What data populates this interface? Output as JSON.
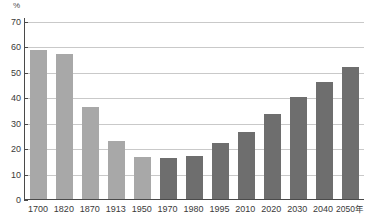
{
  "chart_data": {
    "type": "bar",
    "title": "",
    "subtitle": "",
    "xlabel": "",
    "ylabel": "",
    "unit_label": "%",
    "axis_suffix": "年",
    "categories": [
      "1700",
      "1820",
      "1870",
      "1913",
      "1950",
      "1970",
      "1980",
      "1995",
      "2010",
      "2020",
      "2030",
      "2040",
      "2050年"
    ],
    "values": [
      58.5,
      57,
      36,
      23,
      16.5,
      16,
      17,
      22,
      26.5,
      33.5,
      40,
      46,
      52
    ],
    "bar_styles": [
      "light",
      "light",
      "light",
      "light",
      "light",
      "dark",
      "dark",
      "dark",
      "dark",
      "dark",
      "dark",
      "dark",
      "dark"
    ],
    "ylim": [
      0,
      70
    ],
    "yticks": [
      0,
      10,
      20,
      30,
      40,
      50,
      60,
      70
    ],
    "ytick_labels": [
      "0",
      "10",
      "20",
      "30",
      "40",
      "50",
      "60",
      "70"
    ],
    "grid": true,
    "grid_axis": "y",
    "legend": null,
    "legend_position": "none",
    "colors": {
      "bar_light": "#a8a8a8",
      "bar_dark": "#6e6e6e",
      "gridline": "#c9c9c9",
      "axis": "#4a4a4a",
      "text": "#3a3a3a",
      "background": "#ffffff"
    }
  }
}
